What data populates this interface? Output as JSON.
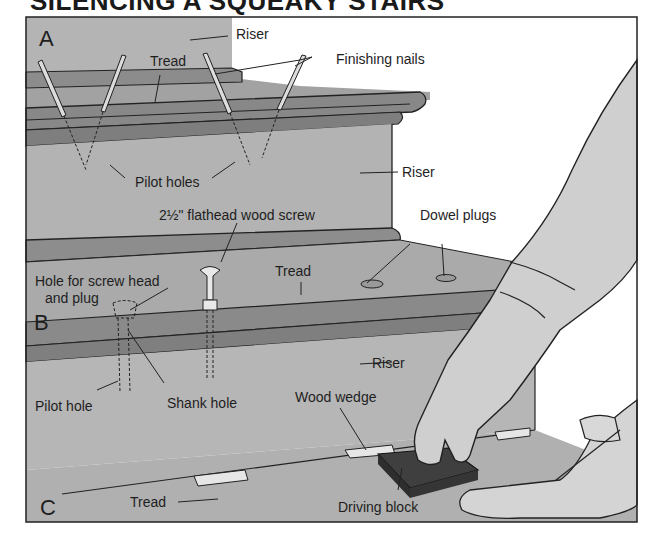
{
  "title": "SILENCING A SQUEAKY STAIRS",
  "panels": {
    "a": "A",
    "b": "B",
    "c": "C"
  },
  "labels": {
    "riser_top": "Riser",
    "tread_a": "Tread",
    "finishing_nails": "Finishing nails",
    "pilot_holes": "Pilot holes",
    "riser_mid": "Riser",
    "flathead_screw": "2½\" flathead wood screw",
    "dowel_plugs": "Dowel plugs",
    "tread_b": "Tread",
    "hole_screw_head": "Hole for screw head",
    "and_plug": "and plug",
    "shank_hole": "Shank hole",
    "pilot_hole": "Pilot hole",
    "riser_low": "Riser",
    "wood_wedge": "Wood wedge",
    "tread_c": "Tread",
    "driving_block": "Driving block"
  },
  "colors": {
    "frame": "#222222",
    "background_gray": "#b5b5b5",
    "riser_gray": "#b0b0b0",
    "tread_dark": "#8e8e8e",
    "nosing": "#7d7d7d",
    "skin": "#cdcdcd",
    "block": "#444444",
    "wedge": "#e4e4e4",
    "paper": "#ffffff"
  }
}
